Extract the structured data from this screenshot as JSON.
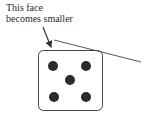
{
  "diagram": {
    "annotation": {
      "line1": "This face",
      "line2": "becomes smaller"
    },
    "die": {
      "face_value": 5,
      "pips": 5
    },
    "colors": {
      "stroke": "#333333",
      "pip": "#2b2b2b",
      "background": "#ffffff"
    }
  }
}
